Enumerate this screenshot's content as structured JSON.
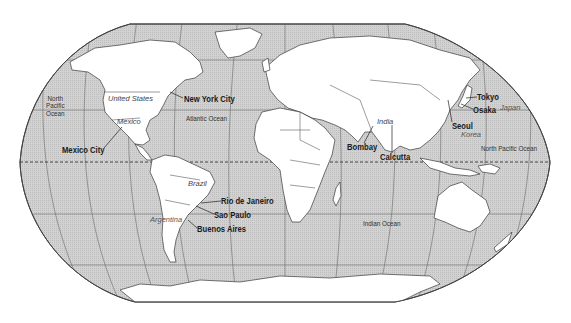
{
  "map": {
    "projection": "Robinson (world)",
    "colors": {
      "ocean": "#cdcdcd",
      "land": "#ffffff",
      "border": "#3a3a3a",
      "graticule": "#6a6a6a"
    },
    "cities": [
      {
        "name": "New York City",
        "x": 184,
        "y": 95
      },
      {
        "name": "Mexico City",
        "x": 62,
        "y": 146
      },
      {
        "name": "Rio de Janeiro",
        "x": 221,
        "y": 197
      },
      {
        "name": "Sao Paulo",
        "x": 214,
        "y": 211
      },
      {
        "name": "Buenos Aires",
        "x": 197,
        "y": 225
      },
      {
        "name": "Bombay",
        "x": 347,
        "y": 143
      },
      {
        "name": "Calcutta",
        "x": 380,
        "y": 153
      },
      {
        "name": "Tokyo",
        "x": 477,
        "y": 93
      },
      {
        "name": "Osaka",
        "x": 473,
        "y": 106
      },
      {
        "name": "Seoul",
        "x": 452,
        "y": 122
      }
    ],
    "countries": [
      {
        "name": "United States",
        "x": 108,
        "y": 95
      },
      {
        "name": "Mexico",
        "x": 117,
        "y": 118
      },
      {
        "name": "Brazil",
        "x": 188,
        "y": 180
      },
      {
        "name": "Argentina",
        "x": 150,
        "y": 216
      },
      {
        "name": "India",
        "x": 377,
        "y": 118
      },
      {
        "name": "Japan",
        "x": 500,
        "y": 104
      },
      {
        "name": "Korea",
        "x": 461,
        "y": 131
      }
    ],
    "oceans": [
      {
        "name": "North Pacific Ocean",
        "lines": [
          "North",
          "Pacific",
          "Ocean"
        ],
        "x": 46,
        "y": 95
      },
      {
        "name": "Atlantic Ocean",
        "x": 186,
        "y": 115
      },
      {
        "name": "North Pacific Ocean",
        "x": 481,
        "y": 145
      },
      {
        "name": "Indian Ocean",
        "x": 363,
        "y": 220
      }
    ]
  }
}
